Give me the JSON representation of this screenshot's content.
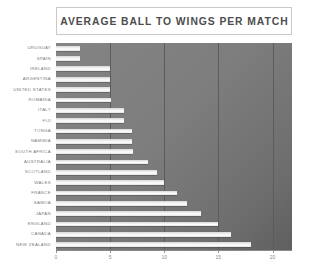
{
  "chart_data": {
    "type": "bar",
    "orientation": "horizontal",
    "title": "AVERAGE BALL TO WINGS PER MATCH",
    "xlabel": "",
    "ylabel": "",
    "xlim": [
      0,
      21.8
    ],
    "xticks": [
      0,
      5,
      10,
      15,
      20
    ],
    "xtick_labels": [
      "0",
      "5",
      "10",
      "15",
      "20"
    ],
    "grid": true,
    "grid_axis": "x",
    "legend": false,
    "categories": [
      "URUGUAY",
      "SPAIN",
      "IRELAND",
      "ARGENTINA",
      "UNITED STATES",
      "ROMANIA",
      "ITALY",
      "FIJI",
      "TONGA",
      "NAMIBIA",
      "SOUTH AFRICA",
      "AUSTRALIA",
      "SCOTLAND",
      "WALES",
      "FRANCE",
      "SAMOA",
      "JAPAN",
      "ENGLAND",
      "CANADA",
      "NEW ZEALAND"
    ],
    "values": [
      2.2,
      2.2,
      5.0,
      5.0,
      5.0,
      5.1,
      6.3,
      6.3,
      7.0,
      7.0,
      7.1,
      8.5,
      9.3,
      10.0,
      11.2,
      12.1,
      13.4,
      15.0,
      16.2,
      18.0
    ],
    "bar_color": "#f2f2f2",
    "plot_background": "#7d7d7d",
    "gridline_color": "#5c5c5c",
    "title_text_color": "#4d4d4d",
    "tick_label_color": "#8d8d8d",
    "category_label_color": "#7b7b7b"
  }
}
